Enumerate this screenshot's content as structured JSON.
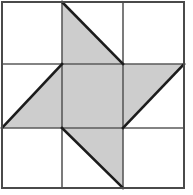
{
  "figure": {
    "title": "Pinwheel Star Quilt Block",
    "type": "quilt-block-diagram",
    "grid_rows": 3,
    "grid_cols": 3,
    "canvas_width": 193,
    "canvas_height": 195
  },
  "colors": {
    "background": "#ffffff",
    "fill_light": "#ffffff",
    "fill_shaded": "#cdcdcd",
    "grid_line": "#5a5a5a",
    "outer_frame": "#4a4a4a",
    "diagonal_line": "#1c1c1c"
  },
  "geometry": {
    "frame": {
      "x": 2,
      "y": 2,
      "width": 182,
      "height": 186
    },
    "x_divisions": [
      2,
      62,
      123,
      184
    ],
    "y_divisions": [
      2,
      64,
      128,
      188
    ],
    "grid_stroke_width": 1.6,
    "frame_stroke_width": 2,
    "diagonal_stroke_width": 2.6
  },
  "cells": [
    {
      "id": "cell-r1c1",
      "row": 1,
      "col": 1,
      "label": "top-left",
      "shape": "square",
      "fill": "light"
    },
    {
      "id": "cell-r1c2",
      "row": 1,
      "col": 2,
      "label": "top-middle",
      "shape": "half-square-triangle",
      "fill": "shaded",
      "filled_corner": "bottom-left",
      "hypotenuse": "top-left-to-bottom-right"
    },
    {
      "id": "cell-r1c3",
      "row": 1,
      "col": 3,
      "label": "top-right",
      "shape": "square",
      "fill": "light"
    },
    {
      "id": "cell-r2c1",
      "row": 2,
      "col": 1,
      "label": "middle-left",
      "shape": "half-square-triangle",
      "fill": "shaded",
      "filled_corner": "bottom-right",
      "hypotenuse": "top-right-to-bottom-left"
    },
    {
      "id": "cell-r2c2",
      "row": 2,
      "col": 2,
      "label": "center",
      "shape": "square",
      "fill": "shaded"
    },
    {
      "id": "cell-r2c3",
      "row": 2,
      "col": 3,
      "label": "middle-right",
      "shape": "half-square-triangle",
      "fill": "shaded",
      "filled_corner": "top-left",
      "hypotenuse": "top-right-to-bottom-left"
    },
    {
      "id": "cell-r3c1",
      "row": 3,
      "col": 1,
      "label": "bottom-left",
      "shape": "square",
      "fill": "light"
    },
    {
      "id": "cell-r3c2",
      "row": 3,
      "col": 2,
      "label": "bottom-middle",
      "shape": "half-square-triangle",
      "fill": "shaded",
      "filled_corner": "top-right",
      "hypotenuse": "top-left-to-bottom-right"
    },
    {
      "id": "cell-r3c3",
      "row": 3,
      "col": 3,
      "label": "bottom-right",
      "shape": "square",
      "fill": "light"
    }
  ],
  "shaded_polygons": {
    "top_middle_triangle": "62,2 123,64 62,64",
    "middle_left_triangle": "62,64 62,128 2,128",
    "center_square": "62,64 123,64 123,128 62,128",
    "middle_right_triangle": "123,64 184,64 123,128",
    "bottom_middle_triangle": "62,128 123,128 123,188"
  },
  "diagonal_segments": [
    {
      "name": "top-middle-diagonal",
      "x1": 62,
      "y1": 2,
      "x2": 123,
      "y2": 64
    },
    {
      "name": "middle-left-diagonal",
      "x1": 62,
      "y1": 64,
      "x2": 2,
      "y2": 128
    },
    {
      "name": "middle-right-diagonal",
      "x1": 184,
      "y1": 64,
      "x2": 123,
      "y2": 128
    },
    {
      "name": "bottom-middle-diagonal",
      "x1": 62,
      "y1": 128,
      "x2": 123,
      "y2": 188
    }
  ]
}
